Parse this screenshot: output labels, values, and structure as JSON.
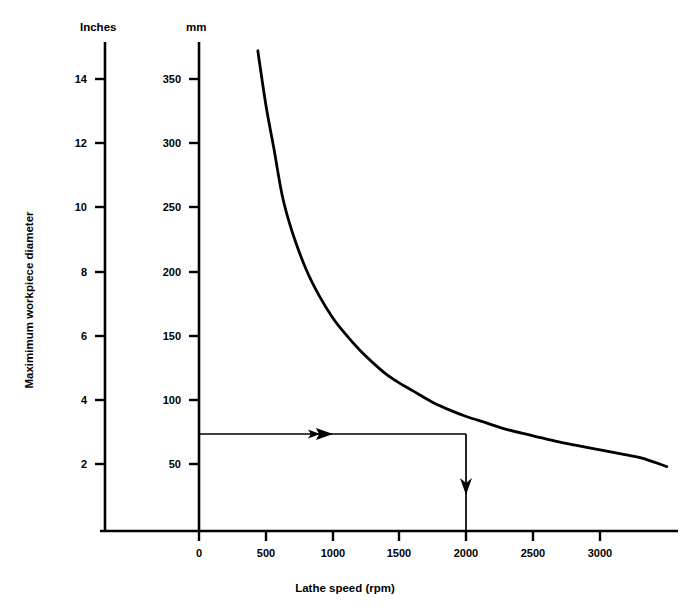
{
  "chart_data": {
    "type": "line",
    "title": "",
    "xlabel": "Lathe speed (rpm)",
    "ylabel": "Maximimum workpiece diameter",
    "grid": false,
    "legend": "none",
    "xlim": [
      0,
      3500
    ],
    "xticks": [
      0,
      500,
      1000,
      1500,
      2000,
      2500,
      3000
    ],
    "xticklabels": [
      "0",
      "500",
      "1000",
      "1500",
      "2000",
      "2500",
      "3000"
    ],
    "axes": [
      {
        "name": "inches-axis",
        "unit_label": "Inches",
        "ticks": [
          2,
          4,
          6,
          8,
          10,
          12,
          14
        ],
        "ticklabels": [
          "2",
          "4",
          "6",
          "8",
          "10",
          "12",
          "14"
        ],
        "lim": [
          0,
          15.4
        ]
      },
      {
        "name": "mm-axis",
        "unit_label": "mm",
        "ticks": [
          50,
          100,
          150,
          200,
          250,
          300,
          350
        ],
        "ticklabels": [
          "50",
          "100",
          "150",
          "200",
          "250",
          "300",
          "350"
        ],
        "lim": [
          0,
          392
        ]
      }
    ],
    "series": [
      {
        "name": "max-workpiece-diameter",
        "relation": "diameter_mm x speed_rpm = constant (~160000)",
        "x": [
          440,
          500,
          560,
          625,
          700,
          800,
          900,
          1000,
          1090,
          1200,
          1300,
          1400,
          1500,
          1600,
          1750,
          1900,
          2000,
          2150,
          2300,
          2500,
          2700,
          2900,
          3100,
          3300,
          3500
        ],
        "y_mm": [
          372,
          330,
          296,
          258,
          230,
          202,
          181,
          164,
          152,
          139,
          129,
          120,
          113,
          107,
          98,
          91,
          87,
          82,
          77,
          72,
          67,
          63,
          59,
          55,
          48
        ],
        "y_inches": [
          14.65,
          12.99,
          11.65,
          10.16,
          9.06,
          7.95,
          7.13,
          6.46,
          5.98,
          5.47,
          5.08,
          4.72,
          4.45,
          4.21,
          3.86,
          3.58,
          3.43,
          3.23,
          3.03,
          2.83,
          2.64,
          2.48,
          2.32,
          2.17,
          1.89
        ]
      }
    ],
    "annotations": [
      {
        "name": "readout-horizontal",
        "type": "arrow",
        "from": {
          "x": 0,
          "y_mm": 75
        },
        "to": {
          "x": 2000,
          "y_mm": 75
        },
        "direction": "right",
        "value_mm": 75,
        "value_inches": 3
      },
      {
        "name": "readout-vertical",
        "type": "arrow",
        "from": {
          "x": 2000,
          "y_mm": 75
        },
        "to": {
          "x": 2000,
          "y_mm": 0
        },
        "direction": "down",
        "value_rpm": 2000
      }
    ]
  },
  "colors": {
    "curve": "#000000",
    "axis": "#000000",
    "background": "#ffffff",
    "annotation": "#000000"
  }
}
